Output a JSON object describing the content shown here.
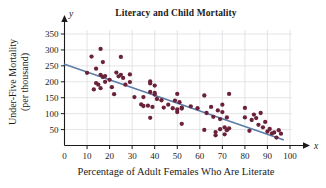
{
  "chart_data": {
    "type": "scatter",
    "title": "Literacy and Child Mortality",
    "xlabel": "Percentage of Adult Females Who Are Literate",
    "ylabel": "Under-Five Mortality (per thousand)",
    "ylabel_lines": [
      "Under-Five Mortality",
      "(per thousand)"
    ],
    "x_symbol": "x",
    "y_symbol": "y",
    "xlim": [
      0,
      100
    ],
    "ylim": [
      0,
      375
    ],
    "xticks": [
      0,
      10,
      20,
      30,
      40,
      50,
      60,
      70,
      80,
      90,
      100
    ],
    "yticks": [
      50,
      100,
      150,
      200,
      250,
      300,
      350
    ],
    "grid": true,
    "grid_color": "#d8d8de",
    "point_color": "#6b2239",
    "line_color": "#5c7ba7",
    "axis_color": "#1b1b1b",
    "legend": null,
    "trendline": {
      "label": "least-squares regression line",
      "x_start": 0,
      "y_start": 255,
      "x_end": 97,
      "y_end": 18
    },
    "points": [
      [
        10,
        228
      ],
      [
        12,
        279
      ],
      [
        13,
        176
      ],
      [
        14,
        241
      ],
      [
        14,
        196
      ],
      [
        15,
        191
      ],
      [
        16,
        303
      ],
      [
        16,
        222
      ],
      [
        16,
        180
      ],
      [
        17,
        262
      ],
      [
        17,
        215
      ],
      [
        18,
        218
      ],
      [
        18,
        200
      ],
      [
        20,
        206
      ],
      [
        21,
        183
      ],
      [
        22,
        161
      ],
      [
        23,
        229
      ],
      [
        24,
        217
      ],
      [
        25,
        278
      ],
      [
        25,
        222
      ],
      [
        26,
        212
      ],
      [
        27,
        191
      ],
      [
        29,
        223
      ],
      [
        29,
        199
      ],
      [
        31,
        152
      ],
      [
        34,
        129
      ],
      [
        35,
        152
      ],
      [
        35,
        124
      ],
      [
        37,
        125
      ],
      [
        38,
        201
      ],
      [
        38,
        195
      ],
      [
        38,
        168
      ],
      [
        38,
        87
      ],
      [
        39,
        121
      ],
      [
        40,
        188
      ],
      [
        40,
        165
      ],
      [
        40,
        160
      ],
      [
        41,
        146
      ],
      [
        43,
        142
      ],
      [
        44,
        119
      ],
      [
        46,
        128
      ],
      [
        48,
        117
      ],
      [
        49,
        141
      ],
      [
        50,
        162
      ],
      [
        50,
        113
      ],
      [
        50,
        105
      ],
      [
        51,
        136
      ],
      [
        52,
        119
      ],
      [
        52,
        116
      ],
      [
        52,
        68
      ],
      [
        56,
        123
      ],
      [
        59,
        117
      ],
      [
        62,
        157
      ],
      [
        62,
        49
      ],
      [
        63,
        102
      ],
      [
        65,
        121
      ],
      [
        66,
        90
      ],
      [
        67,
        42
      ],
      [
        67,
        32
      ],
      [
        68,
        110
      ],
      [
        69,
        83
      ],
      [
        69,
        51
      ],
      [
        70,
        128
      ],
      [
        70,
        105
      ],
      [
        71,
        57
      ],
      [
        71,
        35
      ],
      [
        72,
        88
      ],
      [
        72,
        48
      ],
      [
        73,
        162
      ],
      [
        73,
        54
      ],
      [
        80,
        118
      ],
      [
        80,
        88
      ],
      [
        82,
        46
      ],
      [
        83,
        80
      ],
      [
        84,
        97
      ],
      [
        85,
        86
      ],
      [
        86,
        65
      ],
      [
        87,
        102
      ],
      [
        88,
        57
      ],
      [
        89,
        74
      ],
      [
        90,
        44
      ],
      [
        91,
        52
      ],
      [
        92,
        38
      ],
      [
        93,
        41
      ],
      [
        94,
        25
      ],
      [
        95,
        48
      ],
      [
        96,
        37
      ]
    ]
  }
}
